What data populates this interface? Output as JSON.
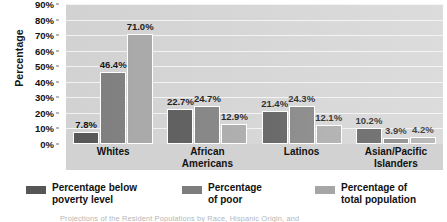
{
  "chart_data": {
    "type": "bar",
    "title": "",
    "xlabel": "",
    "ylabel": "Percentage",
    "ylim": [
      0,
      90
    ],
    "ytick_labels": [
      "0%",
      "10%",
      "20%",
      "30%",
      "40%",
      "50%",
      "60%",
      "70%",
      "80%",
      "90%"
    ],
    "ytick_values": [
      0,
      10,
      20,
      30,
      40,
      50,
      60,
      70,
      80,
      90
    ],
    "grid": true,
    "legend_position": "bottom",
    "categories": [
      "Whites",
      "African Americans",
      "Latinos",
      "Asian/Pacific Islanders"
    ],
    "category_lines": [
      [
        "Whites"
      ],
      [
        "African",
        "Americans"
      ],
      [
        "Latinos"
      ],
      [
        "Asian/Pacific",
        "Islanders"
      ]
    ],
    "series": [
      {
        "name": "Percentage below poverty level",
        "name_lines": [
          "Percentage below",
          "poverty level"
        ],
        "color": "#565656",
        "values": [
          7.8,
          22.7,
          21.4,
          10.2
        ],
        "labels": [
          "7.8%",
          "22.7%",
          "21.4%",
          "10.2%"
        ]
      },
      {
        "name": "Percentage of poor",
        "name_lines": [
          "Percentage",
          "of poor"
        ],
        "color": "#7d7d7d",
        "values": [
          46.4,
          24.7,
          24.3,
          3.9
        ],
        "labels": [
          "46.4%",
          "24.7%",
          "24.3%",
          "3.9%"
        ]
      },
      {
        "name": "Percentage of total population",
        "name_lines": [
          "Percentage of",
          "total population"
        ],
        "color": "#a6a6a6",
        "values": [
          71.0,
          12.9,
          12.1,
          4.2
        ],
        "labels": [
          "71.0%",
          "12.9%",
          "12.1%",
          "4.2%"
        ]
      }
    ]
  },
  "caption": {
    "text": "Projections of the Resident Populations by Race, Hispanic Origin, and"
  },
  "colors": {
    "plot_background": "#d2d2d2",
    "gridline": "#f2f2f2",
    "text": "#111111"
  }
}
